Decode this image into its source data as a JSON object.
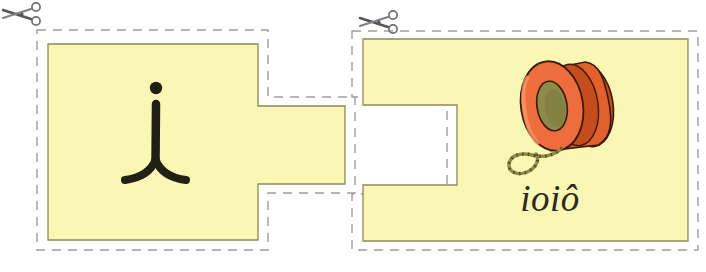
{
  "worksheet": {
    "title": "Cut-and-match letter card pair",
    "background_color": "#ffffff",
    "card_fill_color": "#faf6b4",
    "card_border_color": "#8a8a58",
    "cut_line_color": "#9a9a9a",
    "ink_color": "#221f16"
  },
  "cards": [
    {
      "id": "letter-card",
      "name": "letter-piece",
      "role": "puzzle-piece-left",
      "shape": "rectangle-with-right-tab",
      "content_type": "cursive-letter",
      "letter": "i",
      "letter_script": "cursive",
      "fill": "#faf6b4",
      "cut_icon": "scissors-icon",
      "cut_icon_label": "cut along dashed line"
    },
    {
      "id": "picture-card",
      "name": "picture-piece",
      "role": "puzzle-piece-right",
      "shape": "rectangle-with-left-notch",
      "content_type": "illustration-and-word",
      "word": "ioiô",
      "word_script": "cursive",
      "illustration": "yoyo-illustration",
      "illustration_colors": {
        "body": "#ef6d3c",
        "body_dark": "#b23f19",
        "center": "#8d8a4a",
        "string": "#8d8a4a"
      },
      "fill": "#faf6b4",
      "cut_icon": "scissors-icon",
      "cut_icon_label": "cut along dashed line"
    }
  ],
  "labels": {
    "letter_card_letter": "i",
    "picture_card_word": "ioiô"
  }
}
